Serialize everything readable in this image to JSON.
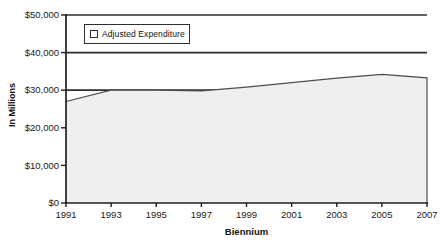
{
  "chart_data": {
    "type": "area",
    "x": [
      1991,
      1993,
      1995,
      1997,
      1999,
      2001,
      2003,
      2005,
      2007
    ],
    "series": [
      {
        "name": "Adjusted Expenditure",
        "values": [
          27000,
          30000,
          30000,
          29800,
          30800,
          32000,
          33200,
          34200,
          33300
        ]
      }
    ],
    "xlabel": "Biennium",
    "ylabel": "In Millions",
    "ylim": [
      0,
      50000
    ],
    "ytick_step": 10000,
    "ytick_labels": [
      "$0",
      "$10,000",
      "$20,000",
      "$30,000",
      "$40,000",
      "$50,000"
    ],
    "grid": true,
    "legend_position": "top-left",
    "colors": {
      "area_fill": "#efefef",
      "line": "#4d4d4d",
      "grid": "#2e2e2e",
      "axis": "#1f1f1f",
      "text": "#1a1a1a",
      "background": "#ffffff",
      "legend_swatch": "#ffffff"
    }
  }
}
